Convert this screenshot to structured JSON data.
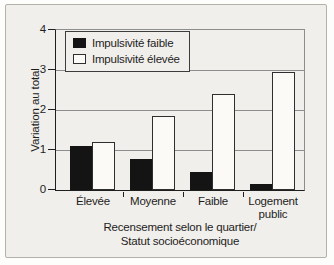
{
  "chart_data": {
    "type": "bar",
    "categories": [
      "Élevée",
      "Moyenne",
      "Faible",
      "Logement public"
    ],
    "series": [
      {
        "name": "Impulsivité faible",
        "color": "#141414",
        "values": [
          1.1,
          0.78,
          0.45,
          0.15
        ]
      },
      {
        "name": "Impulsivité élevée",
        "color": "#fbfaf7",
        "values": [
          1.2,
          1.85,
          2.4,
          2.95
        ]
      }
    ],
    "title": "",
    "ylabel": "Variation au total",
    "xlabel_line1": "Recensement selon le quartier/",
    "xlabel_line2": "Statut socioéconomique",
    "ylim": [
      0,
      4
    ],
    "yticks": [
      0,
      1,
      2,
      3,
      4
    ],
    "grid": "horizontal",
    "legend_position": "top-left"
  },
  "colors": {
    "panel_background": "#f1efeb",
    "frame_border": "#b4b1ab",
    "gridline": "#8d8d8d",
    "axis": "#1f1f1f",
    "bar_filled": "#141414",
    "bar_open": "#fbfaf7",
    "text": "#1d1d1d"
  }
}
